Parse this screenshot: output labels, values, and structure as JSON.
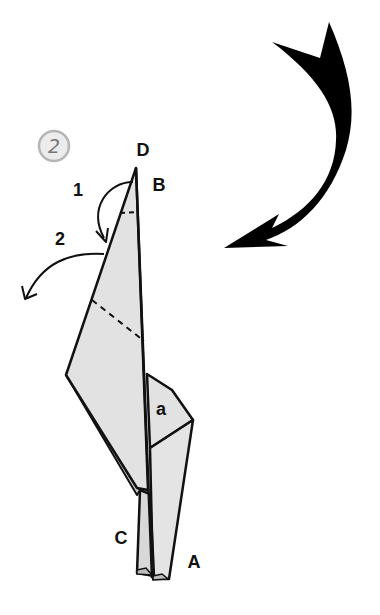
{
  "diagram": {
    "step_number": "2",
    "point_labels": {
      "D": "D",
      "B": "B",
      "C": "C",
      "A": "A",
      "flap": "a"
    },
    "fold_step_labels": [
      "1",
      "2"
    ],
    "colors": {
      "paper": "#e2e2e2",
      "paper_shadow": "#cfcfcf",
      "line": "#111111",
      "arrow": "#000000",
      "step_circle_fill": "#ececec",
      "step_circle_stroke": "#b5b5b5"
    },
    "annotations": {
      "big_arrow": "turn-over arrow",
      "arrow_1": "valley fold tip down",
      "arrow_2": "fold out to left"
    }
  }
}
